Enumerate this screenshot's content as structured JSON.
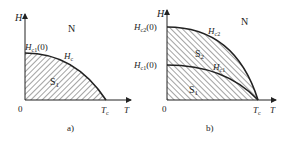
{
  "figure": {
    "panel_a": {
      "caption": "a)",
      "axis_y_label": "H",
      "axis_x_label": "T",
      "origin_label": "0",
      "region_normal": "N",
      "region_super": "S",
      "region_super_sub": "1",
      "curve_label": "H",
      "curve_label_sub": "c",
      "y_intercept_label": "H",
      "y_intercept_sub": "c1",
      "y_intercept_suffix": "(0)",
      "x_intercept_label": "T",
      "x_intercept_sub": "c"
    },
    "panel_b": {
      "caption": "b)",
      "axis_y_label": "H",
      "axis_x_label": "T",
      "origin_label": "0",
      "region_normal": "N",
      "region_mixed": "S",
      "region_mixed_sub": "2",
      "region_super": "S",
      "region_super_sub": "1",
      "curve_upper_label": "H",
      "curve_upper_sub": "c2",
      "curve_lower_label": "H",
      "curve_lower_sub": "c1",
      "y_intercept_upper_label": "H",
      "y_intercept_upper_sub": "c2",
      "y_intercept_upper_suffix": "(0)",
      "y_intercept_lower_label": "H",
      "y_intercept_lower_sub": "c1",
      "y_intercept_lower_suffix": "(0)",
      "x_intercept_label": "T",
      "x_intercept_sub": "c"
    },
    "colors": {
      "line": "#222222",
      "background": "#ffffff"
    }
  }
}
